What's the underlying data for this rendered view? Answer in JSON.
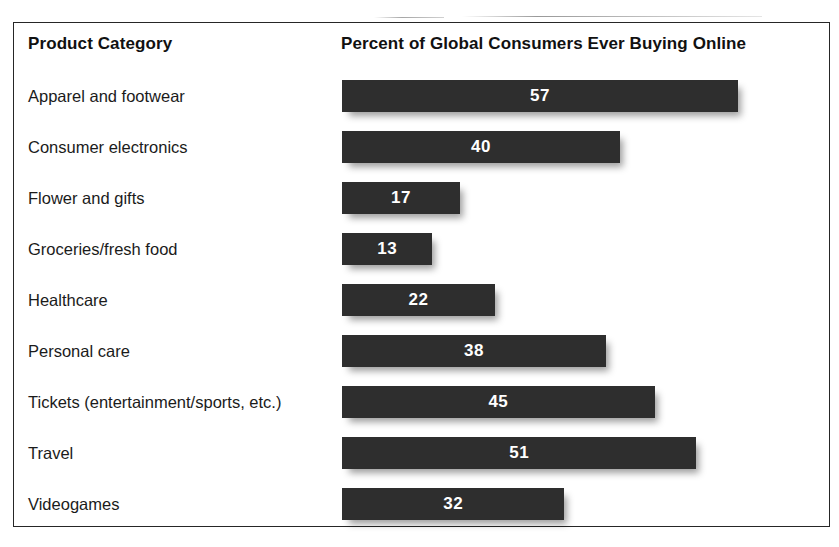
{
  "chart_data": {
    "type": "bar",
    "orientation": "horizontal",
    "title": "",
    "xlabel": "",
    "ylabel": "",
    "grid": false,
    "legend": null,
    "value_labels": true,
    "axis_range": [
      0,
      57
    ],
    "px_per_unit": 6.95,
    "columns": [
      "Product Category",
      "Percent of Global Consumers Ever Buying Online"
    ],
    "categories": [
      "Apparel and footwear",
      "Consumer electronics",
      "Flower and gifts",
      "Groceries/fresh food",
      "Healthcare",
      "Personal care",
      "Tickets (entertainment/sports, etc.)",
      "Travel",
      "Videogames"
    ],
    "values": [
      57,
      40,
      17,
      13,
      22,
      38,
      45,
      51,
      32
    ],
    "bar_color": "#2e2e2e",
    "value_label_color": "#ffffff",
    "rows": [
      {
        "label": "Apparel and footwear",
        "value": 57
      },
      {
        "label": "Consumer electronics",
        "value": 40
      },
      {
        "label": "Flower and gifts",
        "value": 17
      },
      {
        "label": "Groceries/fresh food",
        "value": 13
      },
      {
        "label": "Healthcare",
        "value": 22
      },
      {
        "label": "Personal care",
        "value": 38
      },
      {
        "label": "Tickets (entertainment/sports, etc.)",
        "value": 45
      },
      {
        "label": "Travel",
        "value": 51
      },
      {
        "label": "Videogames",
        "value": 32
      }
    ]
  },
  "header": {
    "category_column": "Product Category",
    "value_column": "Percent of Global Consumers Ever Buying Online"
  }
}
